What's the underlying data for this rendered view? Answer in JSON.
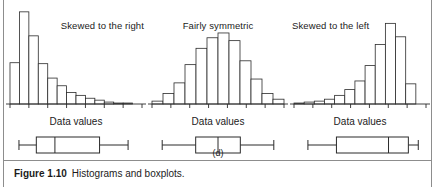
{
  "figure": {
    "caption_number": "Figure 1.10",
    "caption_text": "Histograms and boxplots.",
    "subfigure_label": "(d)",
    "axis_label": "Data values",
    "ink_color": "#2b2b2b",
    "rule_color": "#8d8d8d",
    "background": "#ffffff"
  },
  "panels": [
    {
      "id": "a",
      "title": "Skewed to the right"
    },
    {
      "id": "b",
      "title": "Fairly symmetric"
    },
    {
      "id": "c",
      "title": "Skewed to the left"
    }
  ],
  "chart_data": [
    {
      "type": "bar",
      "title": "Skewed to the right",
      "xlabel": "Data values",
      "ylabel": "",
      "grid": false,
      "legend": "none",
      "axis_ticks": 8,
      "categories": [
        "1",
        "2",
        "3",
        "4",
        "5",
        "6",
        "7",
        "8",
        "9",
        "10",
        "11",
        "12",
        "13",
        "14"
      ],
      "values": [
        43,
        96,
        71,
        42,
        27,
        19,
        12,
        9,
        6,
        4,
        2,
        1,
        1,
        0
      ],
      "ylim": [
        0,
        100
      ],
      "boxplot": {
        "min": 4,
        "q1": 18,
        "median": 33,
        "q3": 69,
        "max": 92
      }
    },
    {
      "type": "bar",
      "title": "Fairly symmetric",
      "xlabel": "Data values",
      "ylabel": "",
      "grid": false,
      "legend": "none",
      "axis_ticks": 8,
      "categories": [
        "1",
        "2",
        "3",
        "4",
        "5",
        "6",
        "7",
        "8",
        "9",
        "10",
        "11",
        "12"
      ],
      "values": [
        3,
        11,
        22,
        41,
        58,
        69,
        74,
        66,
        45,
        26,
        11,
        5
      ],
      "ylim": [
        0,
        100
      ],
      "boxplot": {
        "min": 5,
        "q1": 32,
        "median": 50,
        "q3": 68,
        "max": 95
      }
    },
    {
      "type": "bar",
      "title": "Skewed to the left",
      "xlabel": "Data values",
      "ylabel": "",
      "grid": false,
      "legend": "none",
      "axis_ticks": 8,
      "categories": [
        "1",
        "2",
        "3",
        "4",
        "5",
        "6",
        "7",
        "8",
        "9",
        "10",
        "11",
        "12",
        "13"
      ],
      "values": [
        1,
        2,
        3,
        5,
        9,
        15,
        24,
        40,
        62,
        84,
        70,
        21,
        0
      ],
      "ylim": [
        0,
        100
      ],
      "boxplot": {
        "min": 8,
        "q1": 31,
        "median": 73,
        "q3": 89,
        "max": 97
      }
    }
  ]
}
